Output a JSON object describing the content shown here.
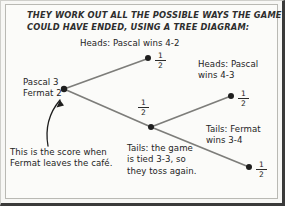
{
  "figure": {
    "type": "tree-diagram",
    "header": "THEY WORK OUT ALL THE POSSIBLE WAYS THE GAME\nCOULD HAVE ENDED, USING A TREE DIAGRAM:",
    "colors": {
      "background": "#fbfbf9",
      "border": "#3a3a3a",
      "ink": "#242424",
      "branch_line": "#7d7d7a",
      "node_fill": "#1e1e1e"
    }
  },
  "labels": {
    "root": "Pascal 3\nFermat 2",
    "heads_4_2": "Heads: Pascal wins 4-2",
    "heads_4_3": "Heads: Pascal\nwins 4-3",
    "tails_3_4": "Tails: Fermat\nwins 3-4",
    "tails_tied": "Tails: the game\nis tied 3-3, so\nthey toss again.",
    "annotation": "This is the score when\nFermat leaves the café."
  },
  "probabilities": {
    "top_branch": {
      "numerator": "1",
      "denominator": "2"
    },
    "bottom_branch": {
      "numerator": "1",
      "denominator": "2"
    },
    "sub_top_branch": {
      "numerator": "1",
      "denominator": "2"
    },
    "sub_bottom_branch": {
      "numerator": "1",
      "denominator": "2"
    }
  },
  "nodes": [
    {
      "id": "root",
      "x": 63,
      "y": 88,
      "label": "Pascal 3 / Fermat 2"
    },
    {
      "id": "heads-4-2",
      "x": 147,
      "y": 57,
      "label": "Heads: Pascal wins 4-2"
    },
    {
      "id": "tails-tied",
      "x": 150,
      "y": 126,
      "label": "Tails: the game is tied 3-3"
    },
    {
      "id": "heads-4-3",
      "x": 230,
      "y": 95,
      "label": "Heads: Pascal wins 4-3"
    },
    {
      "id": "tails-3-4",
      "x": 248,
      "y": 166,
      "label": "Tails: Fermat wins 3-4"
    }
  ],
  "edges": [
    {
      "from": "root",
      "to": "heads-4-2",
      "probability": "1/2"
    },
    {
      "from": "root",
      "to": "tails-tied",
      "probability": "1/2"
    },
    {
      "from": "tails-tied",
      "to": "heads-4-3",
      "probability": "1/2"
    },
    {
      "from": "tails-tied",
      "to": "tails-3-4",
      "probability": "1/2"
    }
  ]
}
